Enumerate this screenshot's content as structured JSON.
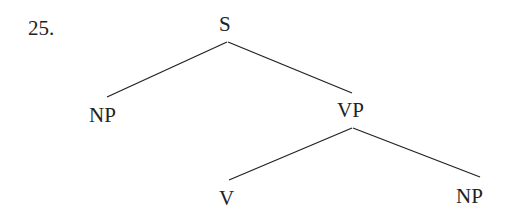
{
  "example_number": "25.",
  "tree": {
    "nodes": {
      "root": "S",
      "subject": "NP",
      "predicate": "VP",
      "verb": "V",
      "object": "NP"
    },
    "edges": [
      [
        "S",
        "NP"
      ],
      [
        "S",
        "VP"
      ],
      [
        "VP",
        "V"
      ],
      [
        "VP",
        "NP"
      ]
    ]
  }
}
